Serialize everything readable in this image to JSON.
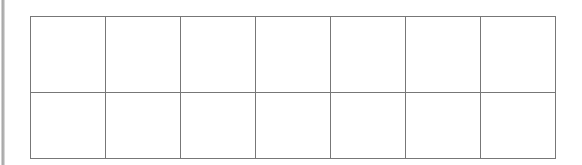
{
  "page": {
    "background_color": "#ffffff",
    "width": 582,
    "height": 165
  },
  "left_edge_strip": {
    "name": "left-edge-strip",
    "color": "#a9a9a9",
    "label": ""
  },
  "table": {
    "name": "empty-grid-table",
    "columns": 7,
    "rows": 2,
    "border_color": "#777777",
    "cell_background": "#ffffff",
    "has_header": false,
    "column_headers": [
      "",
      "",
      "",
      "",
      "",
      "",
      ""
    ],
    "cells": [
      [
        "",
        "",
        "",
        "",
        "",
        "",
        ""
      ],
      [
        "",
        "",
        "",
        "",
        "",
        "",
        ""
      ]
    ]
  }
}
